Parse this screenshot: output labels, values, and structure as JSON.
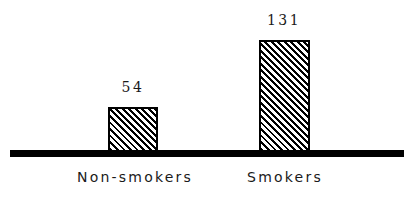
{
  "chart_data": {
    "type": "bar",
    "title": "",
    "subtitle": "",
    "xlabel": "",
    "ylabel": "",
    "categories": [
      "Non-smokers",
      "Smokers"
    ],
    "values": [
      54,
      131
    ],
    "value_labels": [
      "54",
      "131"
    ],
    "series": [
      {
        "name": "",
        "values": [
          54,
          131
        ]
      }
    ],
    "ylim": [
      0,
      131
    ],
    "grid": false,
    "legend": null,
    "annotations": [],
    "style": {
      "background": "#ffffff",
      "ink": "#000000",
      "bar_fill": "diagonal-hatch-45deg",
      "bar_border": "#000000",
      "axis_line": "#000000"
    }
  },
  "bars": [
    {
      "category": "Non-smokers",
      "value_label": "54"
    },
    {
      "category": "Smokers",
      "value_label": "131"
    }
  ]
}
